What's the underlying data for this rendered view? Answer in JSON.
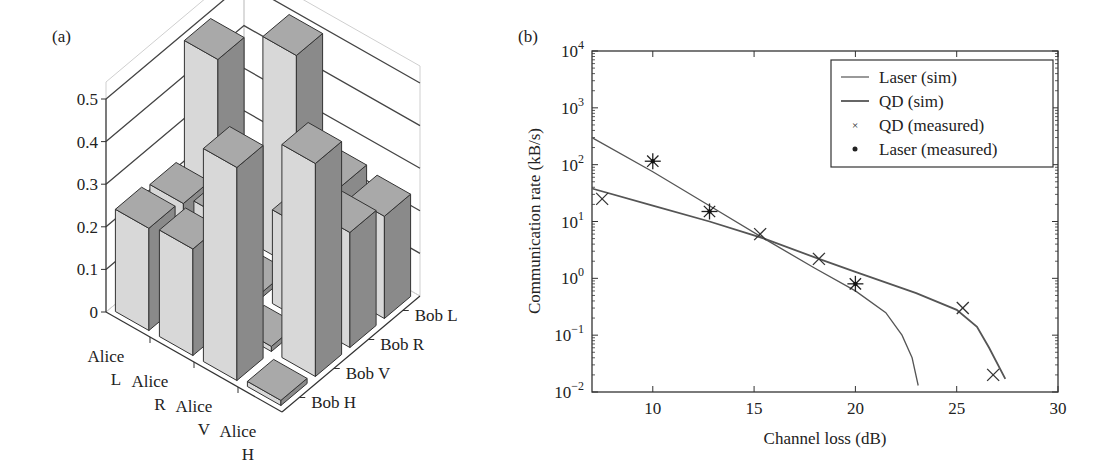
{
  "chart_data": [
    {
      "panel": "(a)",
      "type": "bar3d",
      "title": "",
      "zlabel": "",
      "zticks": [
        "0",
        "0.1",
        "0.2",
        "0.3",
        "0.4",
        "0.5"
      ],
      "zlim": [
        0,
        0.5
      ],
      "alice_labels": [
        [
          "Alice",
          "L"
        ],
        [
          "Alice",
          "R"
        ],
        [
          "Alice",
          "V"
        ],
        [
          "Alice",
          "H"
        ]
      ],
      "bob_labels": [
        "Bob H",
        "Bob V",
        "Bob R",
        "Bob L"
      ],
      "rows_alice": [
        "L",
        "R",
        "V",
        "H"
      ],
      "cols_bob": [
        "H",
        "V",
        "R",
        "L"
      ],
      "values": [
        [
          0.24,
          0.23,
          0.5,
          0.01
        ],
        [
          0.25,
          0.25,
          0.01,
          0.5
        ],
        [
          0.5,
          0.01,
          0.22,
          0.25
        ],
        [
          0.01,
          0.5,
          0.27,
          0.24
        ]
      ]
    },
    {
      "panel": "(b)",
      "type": "line",
      "title": "",
      "xlabel": "Channel loss (dB)",
      "ylabel": "Communication rate (kB/s)",
      "xlim": [
        7,
        30
      ],
      "ylim": [
        0.01,
        10000
      ],
      "yscale": "log",
      "xticks": [
        "10",
        "15",
        "20",
        "25",
        "30"
      ],
      "yticks": [
        "10^-2",
        "10^-1",
        "10^0",
        "10^1",
        "10^2",
        "10^3",
        "10^4"
      ],
      "legend_position": "upper right",
      "legend": [
        "Laser (sim)",
        "QD (sim)",
        "QD (measured)",
        "Laser (measured)"
      ],
      "series": [
        {
          "name": "Laser (sim)",
          "style": "line",
          "x": [
            7,
            10,
            12.8,
            15.5,
            18,
            20,
            21.5,
            22.3,
            22.8,
            23.1
          ],
          "y": [
            300,
            75,
            19,
            5,
            1.5,
            0.6,
            0.25,
            0.1,
            0.04,
            0.013
          ]
        },
        {
          "name": "QD (sim)",
          "style": "line",
          "x": [
            7,
            10,
            12.8,
            15.5,
            18.2,
            20,
            23,
            25,
            26,
            26.6,
            27.4
          ],
          "y": [
            38,
            19,
            10,
            5,
            2.2,
            1.3,
            0.55,
            0.28,
            0.14,
            0.06,
            0.017
          ]
        },
        {
          "name": "QD (measured)",
          "style": "x-marker",
          "x": [
            7.5,
            15.3,
            18.2,
            25.3,
            26.8
          ],
          "y": [
            25,
            6,
            2.2,
            0.3,
            0.02
          ]
        },
        {
          "name": "Laser (measured)",
          "style": "asterisk-marker",
          "x": [
            10,
            12.8,
            20
          ],
          "y": [
            115,
            15,
            0.8
          ]
        }
      ]
    }
  ],
  "panels": {
    "a": {
      "label": "(a)"
    },
    "b": {
      "label": "(b)"
    }
  },
  "colors": {
    "bar_light": "#d8d8d8",
    "bar_top": "#a9a9a9",
    "bar_side": "#8a8a8a",
    "line": "#555555",
    "axis": "#333333",
    "grid": "#444444"
  }
}
